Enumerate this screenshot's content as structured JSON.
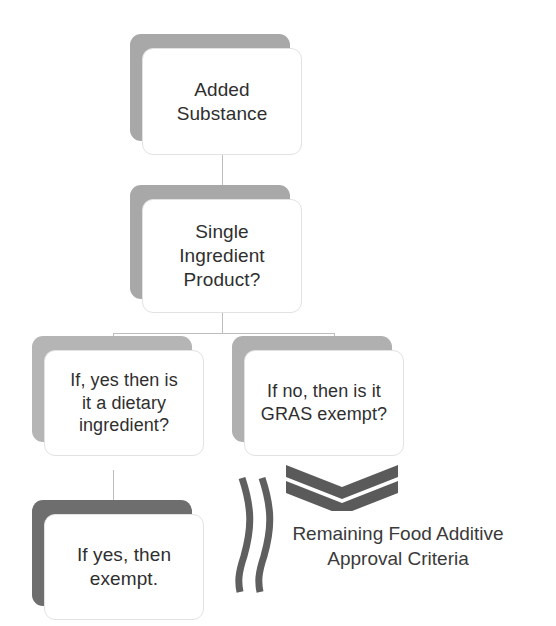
{
  "diagram": {
    "background_color": "#ffffff",
    "text_color": "#2f2f2f",
    "connector_color": "#bdbdbd",
    "accent_gray": "#6e6e6e"
  },
  "nodes": [
    {
      "id": "added-substance",
      "label": "Added\nSubstance",
      "shadow_color": "#a8a8a8"
    },
    {
      "id": "single-ingredient-product",
      "label": "Single\nIngredient\nProduct?",
      "shadow_color": "#a8a8a8"
    },
    {
      "id": "dietary-ingredient",
      "label": "If, yes then is\nit a dietary\ningredient?",
      "shadow_color": "#b5b5b5"
    },
    {
      "id": "gras-exempt",
      "label": "If no, then is it\nGRAS exempt?",
      "shadow_color": "#b0b0b0"
    },
    {
      "id": "exempt",
      "label": "If yes, then\nexempt.",
      "shadow_color": "#6e6e6e"
    }
  ],
  "decorations": {
    "bracket": {
      "name": "double-bracket-divider",
      "color": "#5f5f5f"
    },
    "chevrons": {
      "name": "double-chevron-down",
      "color": "#5a5a5a",
      "count": 2
    }
  },
  "caption": {
    "text": "Remaining Food Additive\nApproval Criteria",
    "color": "#3a3a3a"
  }
}
